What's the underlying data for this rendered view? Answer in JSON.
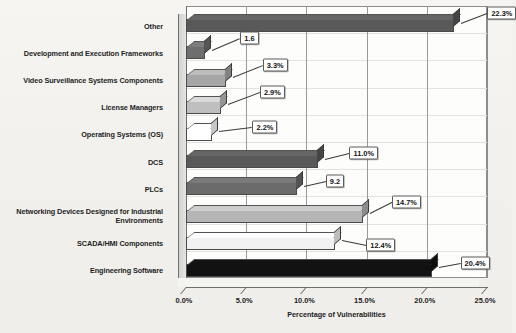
{
  "chart_data": {
    "type": "bar",
    "orientation": "horizontal",
    "title": "",
    "xlabel": "Percentage of Vulnerabilities",
    "ylabel": "",
    "xlim": [
      0,
      25
    ],
    "xticks": [
      "0.0%",
      "5.0%",
      "10.0%",
      "15.0%",
      "20.0%",
      "25.0%"
    ],
    "xtick_values": [
      0,
      5,
      10,
      15,
      20,
      25
    ],
    "grid": true,
    "legend": "none",
    "categories": [
      "Other",
      "Development and Execution Frameworks",
      "Video Surveillance Systems Components",
      "License Managers",
      "Operating Systems (OS)",
      "DCS",
      "PLCs",
      "Networking Devices Designed for Industrial Environments",
      "SCADA/HMI Components",
      "Engineering Software"
    ],
    "values": [
      22.3,
      1.6,
      3.3,
      2.9,
      2.2,
      11.0,
      9.2,
      14.7,
      12.4,
      20.4
    ],
    "data_labels": [
      "22.3%",
      "1.6",
      "3.3%",
      "2.9%",
      "2.2%",
      "11.0%",
      "9.2",
      "14.7%",
      "12.4%",
      "20.4%"
    ],
    "bar_colors": [
      "#595959",
      "#6e6e6e",
      "#a6a6a6",
      "#bfbfbf",
      "#ffffff",
      "#595959",
      "#6b6b6b",
      "#b5b5b5",
      "#f2f2f2",
      "#111111"
    ]
  },
  "axis": {
    "x_title": "Percentage of Vulnerabilities"
  }
}
